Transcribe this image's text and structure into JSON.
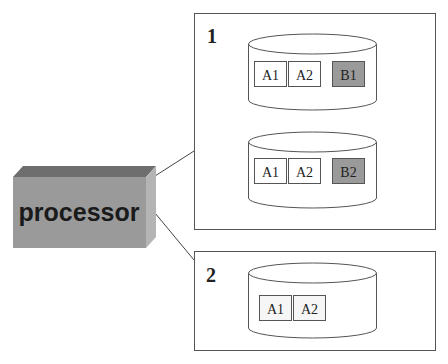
{
  "processor": {
    "label": "processor",
    "colors": {
      "top": "#6e6e6e",
      "front": "#9a9a9a",
      "side": "#b4b4b4"
    }
  },
  "nodes": [
    {
      "id": "1",
      "label": "1",
      "disks": [
        {
          "blocks": [
            {
              "label": "A1",
              "fill": "#ffffff"
            },
            {
              "label": "A2",
              "fill": "#ffffff"
            },
            {
              "label": "B1",
              "fill": "#9a9a9a"
            }
          ]
        },
        {
          "blocks": [
            {
              "label": "A1",
              "fill": "#ffffff"
            },
            {
              "label": "A2",
              "fill": "#ffffff"
            },
            {
              "label": "B2",
              "fill": "#9a9a9a"
            }
          ]
        }
      ]
    },
    {
      "id": "2",
      "label": "2",
      "disks": [
        {
          "blocks": [
            {
              "label": "A1",
              "fill": "#f6f6f6"
            },
            {
              "label": "A2",
              "fill": "#f6f6f6"
            }
          ]
        }
      ]
    }
  ],
  "colors": {
    "stroke": "#555555",
    "text": "#222222"
  }
}
